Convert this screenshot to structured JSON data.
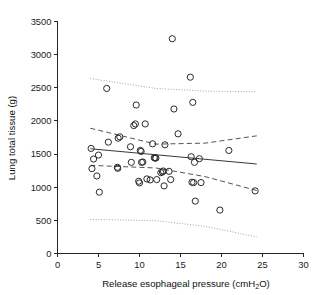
{
  "chart_data": {
    "type": "scatter",
    "title": "",
    "xlabel": "Release esophageal pressure (cmH2O)",
    "xlabel_main": "Release esophageal pressure (cmH",
    "xlabel_sub": "2",
    "xlabel_tail": "O)",
    "ylabel": "Lung total tissue (g)",
    "xlim": [
      0,
      30
    ],
    "ylim": [
      0,
      3500
    ],
    "xticks": [
      0,
      5,
      10,
      15,
      20,
      25,
      30
    ],
    "yticks": [
      0,
      500,
      1000,
      1500,
      2000,
      2500,
      3000,
      3500
    ],
    "grid": false,
    "legend": "none",
    "marker": "open-circle",
    "points": [
      [
        4.1,
        1585
      ],
      [
        4.2,
        1280
      ],
      [
        4.4,
        1425
      ],
      [
        4.8,
        1170
      ],
      [
        5.0,
        1485
      ],
      [
        5.1,
        925
      ],
      [
        6.0,
        2490
      ],
      [
        6.2,
        1680
      ],
      [
        7.3,
        1300
      ],
      [
        7.35,
        1285
      ],
      [
        7.4,
        1740
      ],
      [
        7.6,
        1760
      ],
      [
        8.9,
        1610
      ],
      [
        9.0,
        1375
      ],
      [
        9.3,
        1930
      ],
      [
        9.5,
        1955
      ],
      [
        9.6,
        2240
      ],
      [
        9.9,
        1090
      ],
      [
        10.0,
        1065
      ],
      [
        10.1,
        1555
      ],
      [
        10.2,
        1540
      ],
      [
        10.25,
        1375
      ],
      [
        10.4,
        1380
      ],
      [
        10.7,
        1955
      ],
      [
        10.9,
        1125
      ],
      [
        11.3,
        1110
      ],
      [
        11.6,
        1655
      ],
      [
        11.8,
        1445
      ],
      [
        11.9,
        1440
      ],
      [
        12.0,
        1440
      ],
      [
        12.1,
        1115
      ],
      [
        12.6,
        1220
      ],
      [
        12.8,
        1230
      ],
      [
        12.9,
        1245
      ],
      [
        13.0,
        1020
      ],
      [
        13.1,
        1640
      ],
      [
        13.6,
        1240
      ],
      [
        13.8,
        1115
      ],
      [
        14.0,
        3240
      ],
      [
        14.2,
        2180
      ],
      [
        14.7,
        1805
      ],
      [
        16.2,
        2660
      ],
      [
        16.3,
        1460
      ],
      [
        16.4,
        1075
      ],
      [
        16.5,
        2280
      ],
      [
        16.6,
        1070
      ],
      [
        16.7,
        1375
      ],
      [
        16.8,
        790
      ],
      [
        17.3,
        1430
      ],
      [
        17.5,
        1070
      ],
      [
        19.8,
        655
      ],
      [
        20.9,
        1555
      ],
      [
        24.1,
        945
      ]
    ],
    "fit_line": {
      "label": "regression line",
      "x": [
        4.0,
        24.3
      ],
      "y": [
        1580,
        1350
      ]
    },
    "ci_upper": {
      "label": "confidence band upper",
      "x": [
        4.0,
        12.0,
        18.0,
        24.3
      ],
      "y": [
        1890,
        1650,
        1665,
        1775
      ]
    },
    "ci_lower": {
      "label": "confidence band lower",
      "x": [
        4.0,
        12.0,
        18.0,
        24.3
      ],
      "y": [
        1330,
        1290,
        1160,
        950
      ]
    },
    "pi_upper": {
      "label": "prediction band upper",
      "x": [
        4.0,
        12.0,
        18.0,
        24.3
      ],
      "y": [
        2640,
        2490,
        2450,
        2440
      ]
    },
    "pi_lower": {
      "label": "prediction band lower",
      "x": [
        4.0,
        12.0,
        18.0,
        24.3
      ],
      "y": [
        515,
        495,
        410,
        250
      ]
    }
  }
}
